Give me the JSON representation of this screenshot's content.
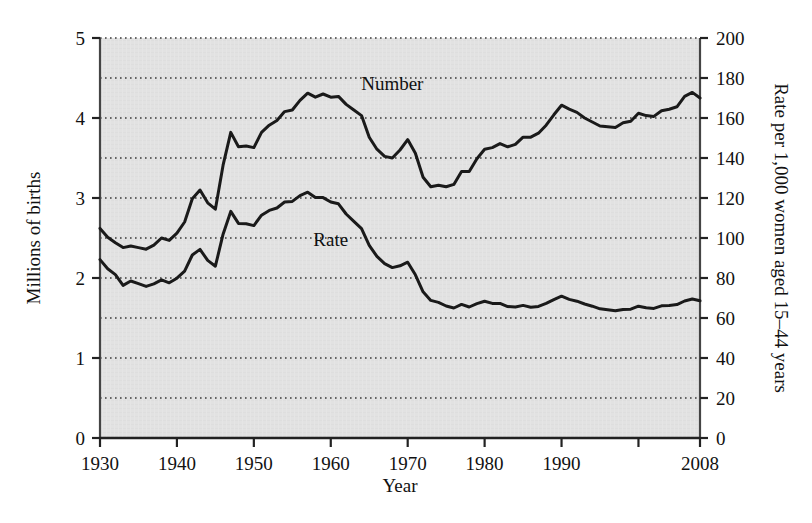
{
  "chart_data": {
    "type": "line",
    "title": "",
    "xlabel": "Year",
    "ylabel": "Millions of births",
    "y2label": "Rate per 1,000 women aged 15–44 years",
    "xlim": [
      1930,
      2008
    ],
    "ylim": [
      0,
      5
    ],
    "y2lim": [
      0,
      200
    ],
    "grid": true,
    "grid_style": "dotted-horizontal",
    "legend": "inline-annotations",
    "xticks": [
      1930,
      1940,
      1950,
      1960,
      1970,
      1980,
      1990,
      2000
    ],
    "xtick_labels": [
      "1930",
      "1940",
      "1950",
      "1960",
      "1970",
      "1980",
      "1990",
      "2008"
    ],
    "yticks": [
      0,
      1,
      2,
      3,
      4,
      5
    ],
    "ytick_labels": [
      "0",
      "1",
      "2",
      "3",
      "4",
      "5"
    ],
    "y_minor_gridlines": [
      0.5,
      1.5,
      2.5,
      3.5,
      4.5
    ],
    "y2ticks": [
      0,
      20,
      40,
      60,
      80,
      100,
      120,
      140,
      160,
      180,
      200
    ],
    "y2tick_labels": [
      "0",
      "20",
      "40",
      "60",
      "80",
      "100",
      "120",
      "140",
      "160",
      "180",
      "200"
    ],
    "plot_background": "#e1e1e1",
    "line_color": "#1a1a1a",
    "line_width": 3,
    "x": [
      1930,
      1931,
      1932,
      1933,
      1934,
      1935,
      1936,
      1937,
      1938,
      1939,
      1940,
      1941,
      1942,
      1943,
      1944,
      1945,
      1946,
      1947,
      1948,
      1949,
      1950,
      1951,
      1952,
      1953,
      1954,
      1955,
      1956,
      1957,
      1958,
      1959,
      1960,
      1961,
      1962,
      1963,
      1964,
      1965,
      1966,
      1967,
      1968,
      1969,
      1970,
      1971,
      1972,
      1973,
      1974,
      1975,
      1976,
      1977,
      1978,
      1979,
      1980,
      1981,
      1982,
      1983,
      1984,
      1985,
      1986,
      1987,
      1988,
      1989,
      1990,
      1991,
      1992,
      1993,
      1994,
      1995,
      1996,
      1997,
      1998,
      1999,
      2000,
      2001,
      2002,
      2003,
      2004,
      2005,
      2006,
      2007,
      2008
    ],
    "series": [
      {
        "name": "Number",
        "units": "millions of births",
        "axis": "left",
        "annotation": "Number",
        "values": [
          2.62,
          2.51,
          2.44,
          2.38,
          2.4,
          2.38,
          2.36,
          2.41,
          2.5,
          2.47,
          2.56,
          2.7,
          2.99,
          3.1,
          2.94,
          2.86,
          3.41,
          3.82,
          3.64,
          3.65,
          3.63,
          3.82,
          3.91,
          3.97,
          4.08,
          4.1,
          4.22,
          4.31,
          4.26,
          4.3,
          4.26,
          4.27,
          4.17,
          4.1,
          4.03,
          3.76,
          3.61,
          3.52,
          3.5,
          3.6,
          3.73,
          3.56,
          3.26,
          3.14,
          3.16,
          3.14,
          3.17,
          3.33,
          3.33,
          3.49,
          3.61,
          3.63,
          3.68,
          3.64,
          3.67,
          3.76,
          3.76,
          3.81,
          3.91,
          4.04,
          4.16,
          4.11,
          4.07,
          4.0,
          3.95,
          3.9,
          3.89,
          3.88,
          3.94,
          3.96,
          4.06,
          4.03,
          4.02,
          4.09,
          4.11,
          4.14,
          4.27,
          4.32,
          4.25
        ]
      },
      {
        "name": "Rate",
        "units": "rate per 1,000 women aged 15-44 years",
        "axis": "right",
        "annotation": "Rate",
        "values": [
          89.2,
          84.6,
          81.7,
          76.3,
          78.5,
          77.2,
          75.8,
          77.1,
          79.1,
          77.6,
          79.9,
          83.4,
          91.5,
          94.3,
          88.8,
          85.9,
          101.9,
          113.3,
          107.3,
          107.1,
          106.2,
          111.4,
          113.8,
          115.0,
          118.0,
          118.3,
          121.2,
          122.9,
          120.2,
          120.2,
          118.0,
          117.1,
          112.0,
          108.3,
          104.7,
          96.3,
          90.8,
          87.2,
          85.2,
          86.1,
          87.9,
          81.6,
          73.1,
          68.8,
          67.8,
          66.0,
          65.0,
          66.8,
          65.5,
          67.2,
          68.4,
          67.3,
          67.3,
          65.7,
          65.5,
          66.3,
          65.4,
          65.8,
          67.3,
          69.2,
          70.9,
          69.3,
          68.4,
          67.0,
          65.9,
          64.6,
          64.1,
          63.6,
          64.3,
          64.4,
          65.9,
          65.1,
          64.8,
          66.1,
          66.3,
          66.7,
          68.5,
          69.5,
          68.6
        ]
      }
    ]
  },
  "annotations": {
    "number_label": "Number",
    "rate_label": "Rate",
    "number_label_x": 1968,
    "rate_label_x": 1960
  },
  "axes": {
    "x_title": "Year",
    "y_left_title": "Millions of births",
    "y_right_title": "Rate per 1,000 women aged 15–44 years"
  }
}
